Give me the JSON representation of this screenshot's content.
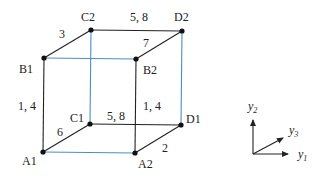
{
  "diagram": {
    "nodes": [
      {
        "id": "A1",
        "label": "A1",
        "x": 43,
        "y": 152,
        "lx": 22,
        "ly": 165
      },
      {
        "id": "A2",
        "label": "A2",
        "x": 135,
        "y": 153,
        "lx": 138,
        "ly": 168
      },
      {
        "id": "B1",
        "label": "B1",
        "x": 44,
        "y": 58,
        "lx": 19,
        "ly": 73
      },
      {
        "id": "B2",
        "label": "B2",
        "x": 136,
        "y": 59,
        "lx": 143,
        "ly": 74
      },
      {
        "id": "C1",
        "label": "C1",
        "x": 90,
        "y": 124,
        "lx": 70,
        "ly": 122
      },
      {
        "id": "C2",
        "label": "C2",
        "x": 91,
        "y": 30,
        "lx": 81,
        "ly": 21
      },
      {
        "id": "D1",
        "label": "D1",
        "x": 181,
        "y": 125,
        "lx": 186,
        "ly": 123
      },
      {
        "id": "D2",
        "label": "D2",
        "x": 182,
        "y": 31,
        "lx": 174,
        "ly": 21
      }
    ],
    "edges": [
      {
        "from": "B1",
        "to": "C2",
        "color": "#222222",
        "label": "3",
        "lx": 59,
        "ly": 38
      },
      {
        "from": "C2",
        "to": "D2",
        "color": "#222222",
        "label": "5, 8",
        "lx": 130,
        "ly": 21
      },
      {
        "from": "D2",
        "to": "B2",
        "color": "#222222",
        "label": "7",
        "lx": 143,
        "ly": 47
      },
      {
        "from": "B1",
        "to": "B2",
        "color": "#4a8ec8",
        "label": "",
        "lx": 0,
        "ly": 0
      },
      {
        "from": "B1",
        "to": "A1",
        "color": "#222222",
        "label": "1, 4",
        "lx": 18,
        "ly": 110
      },
      {
        "from": "B2",
        "to": "A2",
        "color": "#222222",
        "label": "1, 4",
        "lx": 143,
        "ly": 110
      },
      {
        "from": "C2",
        "to": "C1",
        "color": "#4a8ec8",
        "label": "",
        "lx": 0,
        "ly": 0
      },
      {
        "from": "D2",
        "to": "D1",
        "color": "#4a8ec8",
        "label": "",
        "lx": 0,
        "ly": 0
      },
      {
        "from": "A1",
        "to": "C1",
        "color": "#222222",
        "label": "6",
        "lx": 57,
        "ly": 136
      },
      {
        "from": "C1",
        "to": "D1",
        "color": "#222222",
        "label": "5, 8",
        "lx": 107,
        "ly": 120
      },
      {
        "from": "D1",
        "to": "A2",
        "color": "#222222",
        "label": "2",
        "lx": 162,
        "ly": 152
      },
      {
        "from": "A1",
        "to": "A2",
        "color": "#4a8ec8",
        "label": "",
        "lx": 0,
        "ly": 0
      }
    ]
  },
  "axes": {
    "origin": {
      "x": 253,
      "y": 154
    },
    "y1": {
      "base": "y",
      "sub": "1",
      "tx": 298,
      "ty": 158,
      "end_x": 288,
      "end_y": 154
    },
    "y2": {
      "base": "y",
      "sub": "2",
      "tx": 248,
      "ty": 110,
      "end_x": 253,
      "end_y": 120
    },
    "y3": {
      "base": "y",
      "sub": "3",
      "tx": 289,
      "ty": 134,
      "end_x": 283,
      "end_y": 138
    }
  }
}
